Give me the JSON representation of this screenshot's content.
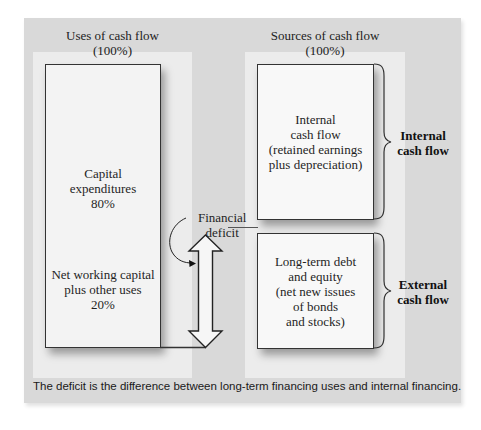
{
  "diagram": {
    "uses": {
      "title": "Uses of cash flow",
      "subtitle": "(100%)",
      "capital_expenditures": {
        "line1": "Capital",
        "line2": "expenditures",
        "percent": "80%"
      },
      "net_working_capital": {
        "line1": "Net working capital",
        "line2": "plus other uses",
        "percent": "20%"
      }
    },
    "sources": {
      "title": "Sources of cash flow",
      "subtitle": "(100%)",
      "internal_box": {
        "line1": "Internal",
        "line2": "cash flow",
        "line3": "(retained earnings",
        "line4": "plus depreciation)"
      },
      "external_box": {
        "line1": "Long-term debt",
        "line2": "and equity",
        "line3": "(net new issues",
        "line4": "of bonds",
        "line5": "and stocks)"
      }
    },
    "brace_labels": {
      "internal_line1": "Internal",
      "internal_line2": "cash flow",
      "external_line1": "External",
      "external_line2": "cash flow"
    },
    "deficit": {
      "line1": "Financial",
      "line2": "deficit"
    },
    "caption": "The deficit is the difference between long-term financing uses and internal financing.",
    "colors": {
      "outer_panel": "#d9d9d9",
      "inner_panel": "#ececec",
      "box_fill": "#f3f3f3",
      "stroke": "#333333"
    }
  }
}
